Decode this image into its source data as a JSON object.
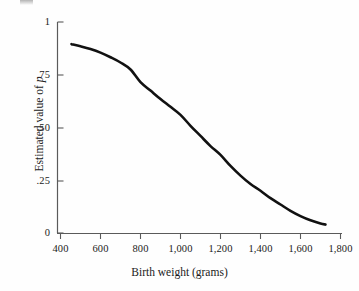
{
  "chart_data": {
    "type": "line",
    "title": "",
    "subtitle": "",
    "xlabel": "Birth weight (grams)",
    "ylabel_prefix": "Estimated value of ",
    "ylabel_italic": "p",
    "ylabel_full": "Estimated value of p",
    "xlim": [
      400,
      1800
    ],
    "ylim": [
      0,
      1
    ],
    "grid": false,
    "legend": null,
    "legend_position": "none",
    "xticks": [
      "400",
      "600",
      "800",
      "1,000",
      "1,200",
      "1,400",
      "1,600",
      "1,800"
    ],
    "xtick_values": [
      400,
      600,
      800,
      1000,
      1200,
      1400,
      1600,
      1800
    ],
    "yticks": [
      "0",
      ".25",
      ".50",
      ".75",
      "1"
    ],
    "ytick_values": [
      0,
      0.25,
      0.5,
      0.75,
      1
    ],
    "series": [
      {
        "name": "Estimated p vs birth weight",
        "color": "#111111",
        "linewidth": 2.6,
        "x": [
          455,
          500,
          550,
          600,
          650,
          700,
          750,
          800,
          850,
          900,
          950,
          1000,
          1050,
          1100,
          1150,
          1200,
          1250,
          1300,
          1350,
          1400,
          1450,
          1500,
          1550,
          1600,
          1650,
          1700,
          1725
        ],
        "values": [
          0.895,
          0.885,
          0.872,
          0.855,
          0.833,
          0.808,
          0.775,
          0.715,
          0.675,
          0.635,
          0.598,
          0.56,
          0.508,
          0.46,
          0.412,
          0.37,
          0.318,
          0.272,
          0.232,
          0.2,
          0.165,
          0.135,
          0.105,
          0.08,
          0.06,
          0.045,
          0.04
        ]
      }
    ],
    "annotations": []
  },
  "figure": {
    "axis_color": "#5a5a5a",
    "text_color": "#1a1a1a",
    "background": "#fefefe"
  }
}
